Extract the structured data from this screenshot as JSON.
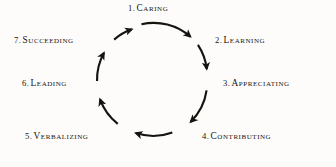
{
  "figure": {
    "kind": "cycle-diagram",
    "background_color": "#fdfcfa",
    "ink_color": "#17130f",
    "direction": "clockwise",
    "step_count": 7,
    "circle": {
      "center_x": 152,
      "center_y": 79,
      "radius": 55
    }
  },
  "steps": [
    {
      "number": "1.",
      "label": "Caring",
      "angle_deg": -90
    },
    {
      "number": "2.",
      "label": "Learning",
      "angle_deg": -38
    },
    {
      "number": "3.",
      "label": "Appreciating",
      "angle_deg": 13
    },
    {
      "number": "4.",
      "label": "Contributing",
      "angle_deg": 64
    },
    {
      "number": "5.",
      "label": "Verbalizing",
      "angle_deg": 116
    },
    {
      "number": "6.",
      "label": "Leading",
      "angle_deg": 167
    },
    {
      "number": "7.",
      "label": "Succeeding",
      "angle_deg": -141
    }
  ]
}
